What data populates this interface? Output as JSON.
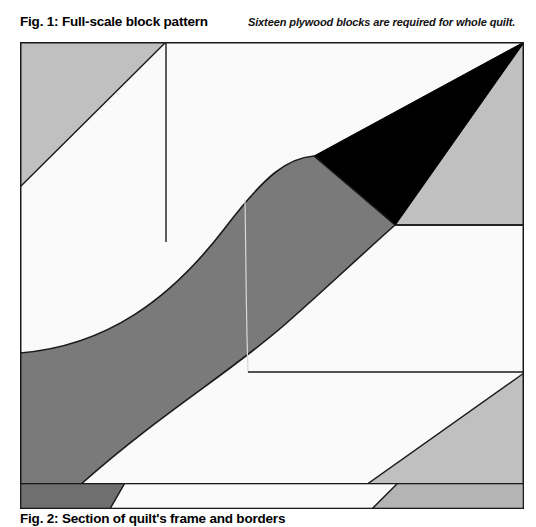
{
  "page": {
    "background": "#ffffff",
    "width": 536,
    "height": 527
  },
  "figure1": {
    "title": "Fig. 1: Full-scale block pattern",
    "note": "Sixteen plywood blocks are required for whole quilt.",
    "art_name": "full-scale-block-pattern-diagram",
    "colors": {
      "black": "#000000",
      "dark_gray": "#7a7a7a",
      "light_gray": "#c0c0c0",
      "white": "#fafafa",
      "outline": "#1a1a1a",
      "seam_line": "#d8d8d8"
    },
    "pieces": [
      {
        "name": "upper-left-light-gray-triangle",
        "fill": "#c0c0c0"
      },
      {
        "name": "upper-left-white-wedge",
        "fill": "#fafafa"
      },
      {
        "name": "upper-right-white-field",
        "fill": "#fafafa"
      },
      {
        "name": "black-triangle",
        "fill": "#000000"
      },
      {
        "name": "right-light-gray-triangle",
        "fill": "#c0c0c0"
      },
      {
        "name": "dark-gray-s-band",
        "fill": "#7a7a7a"
      },
      {
        "name": "lower-right-white-field",
        "fill": "#fafafa"
      },
      {
        "name": "lower-right-light-gray-triangle",
        "fill": "#c0c0c0"
      },
      {
        "name": "lower-left-white-wedge",
        "fill": "#fafafa"
      }
    ]
  },
  "figure2": {
    "title": "Fig. 2: Section of quilt's frame and borders",
    "art_name": "quilt-frame-and-borders-section",
    "colors": {
      "dark_gray": "#6f6f6f",
      "light_gray": "#b4b4b4",
      "white": "#fafafa",
      "outline": "#1a1a1a"
    },
    "pieces": [
      {
        "name": "frame-dark-gray-segment",
        "fill": "#6f6f6f"
      },
      {
        "name": "frame-white-segment",
        "fill": "#fafafa"
      },
      {
        "name": "frame-light-gray-segment",
        "fill": "#b4b4b4"
      }
    ]
  }
}
